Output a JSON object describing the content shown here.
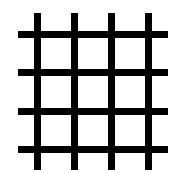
{
  "figure": {
    "line_color": "#000000",
    "background_color": "#ffffff",
    "line_thickness": 7,
    "vertical_lines": [
      {
        "x": 34,
        "y1": 13,
        "y2": 170
      },
      {
        "x": 71,
        "y1": 13,
        "y2": 170
      },
      {
        "x": 108,
        "y1": 13,
        "y2": 170
      },
      {
        "x": 145,
        "y1": 13,
        "y2": 170
      }
    ],
    "horizontal_lines": [
      {
        "y": 31,
        "x1": 18,
        "x2": 168
      },
      {
        "y": 69,
        "x1": 18,
        "x2": 168
      },
      {
        "y": 108,
        "x1": 18,
        "x2": 168
      },
      {
        "y": 146,
        "x1": 18,
        "x2": 168
      }
    ]
  }
}
